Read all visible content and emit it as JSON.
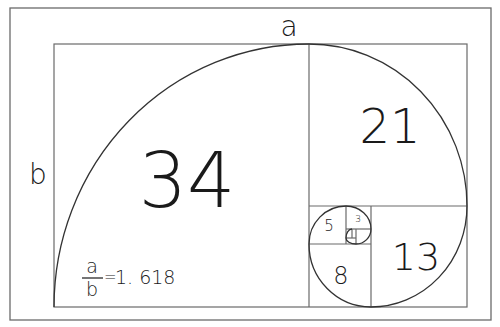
{
  "diagram": {
    "labels": {
      "top": "a",
      "left": "b"
    },
    "formula": {
      "numerator": "a",
      "denominator": "b",
      "equals": "=",
      "value": "1. 618"
    },
    "squares": [
      {
        "label": "34"
      },
      {
        "label": "21"
      },
      {
        "label": "13"
      },
      {
        "label": "8"
      },
      {
        "label": "5"
      },
      {
        "label": "3"
      }
    ],
    "colors": {
      "line": "#6a6a6a",
      "spiral": "#333333",
      "text": "#1a1a1a",
      "background": "#ffffff"
    }
  }
}
